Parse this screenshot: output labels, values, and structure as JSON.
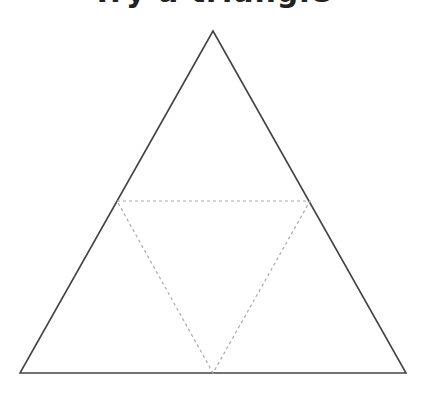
{
  "title": "Try a triangle",
  "diagram": {
    "outer_triangle": {
      "apex": [
        213,
        31
      ],
      "bottom_left": [
        20,
        373
      ],
      "bottom_right": [
        406,
        373
      ],
      "stroke": "#444444",
      "style": "solid"
    },
    "inner_triangle": {
      "left": [
        117,
        201
      ],
      "right": [
        310,
        201
      ],
      "bottom": [
        213,
        373
      ],
      "stroke": "#aaaaaa",
      "style": "dashed"
    }
  }
}
